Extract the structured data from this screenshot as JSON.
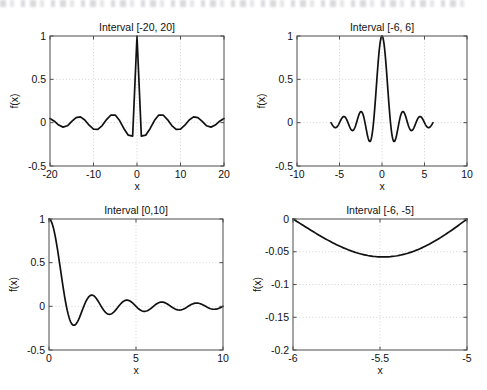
{
  "figure": {
    "width": 487,
    "height": 390,
    "background": "#ffffff",
    "curve_color": "#111111",
    "grid_color": "#c8c8c8",
    "axis_color": "#4d4d4d"
  },
  "chart_data": [
    {
      "id": "subplot-1",
      "type": "line",
      "title": "Interval [-20, 20]",
      "xlabel": "x",
      "ylabel": "f(x)",
      "xlim": [
        -20,
        20
      ],
      "ylim": [
        -0.5,
        1
      ],
      "xticks": [
        -20,
        -10,
        0,
        10,
        20
      ],
      "xticklabels": [
        "-20",
        "-10",
        "0",
        "10",
        "20"
      ],
      "yticks": [
        -0.5,
        0,
        0.5,
        1
      ],
      "yticklabels": [
        "-0.5",
        "0",
        "0.5",
        "1"
      ],
      "grid": true,
      "box": {
        "left": 50,
        "top": 36,
        "right": 224,
        "bottom": 166
      },
      "series": [
        {
          "name": "sinc(x)",
          "comment": "coarse sampling, step 1.0 over [-20,20] -> piecewise linear",
          "x": [
            -20,
            -19,
            -18,
            -17,
            -16,
            -15,
            -14,
            -13,
            -12,
            -11,
            -10,
            -9,
            -8,
            -7,
            -6,
            -5,
            -4,
            -3,
            -2,
            -1,
            0,
            1,
            2,
            3,
            4,
            5,
            6,
            7,
            8,
            9,
            10,
            11,
            12,
            13,
            14,
            15,
            16,
            17,
            18,
            19,
            20
          ],
          "y": [
            0.0477,
            0.0169,
            -0.0273,
            -0.0513,
            -0.0359,
            0.0139,
            0.0585,
            0.0668,
            0.0315,
            -0.0295,
            -0.0753,
            -0.0773,
            -0.0331,
            0.0352,
            0.0884,
            0.0879,
            0.0246,
            -0.0692,
            -0.1446,
            -0.1557,
            1.0,
            -0.1557,
            -0.1446,
            -0.0692,
            0.0246,
            0.0879,
            0.0884,
            0.0352,
            -0.0331,
            -0.0773,
            -0.0753,
            -0.0295,
            0.0315,
            0.0668,
            0.0585,
            0.0139,
            -0.0359,
            -0.0513,
            -0.0273,
            0.0169,
            0.0477
          ]
        }
      ]
    },
    {
      "id": "subplot-2",
      "type": "line",
      "title": "Interval [-6, 6]",
      "xlabel": "x",
      "ylabel": "f(x)",
      "xlim": [
        -10,
        10
      ],
      "ylim": [
        -0.5,
        1
      ],
      "xticks": [
        -10,
        -5,
        0,
        5,
        10
      ],
      "xticklabels": [
        "-10",
        "-5",
        "0",
        "5",
        "10"
      ],
      "yticks": [
        -0.5,
        0,
        0.5,
        1
      ],
      "yticklabels": [
        "-0.5",
        "0",
        "0.5",
        "1"
      ],
      "grid": true,
      "box": {
        "left": 297,
        "top": 36,
        "right": 467,
        "bottom": 166
      },
      "series": [
        {
          "name": "sinc(x) on [-6, 6]",
          "comment": "smooth sinc sampled finely, drawn only over data interval -6..6",
          "data_range": [
            -6,
            6
          ],
          "formula": "sinc",
          "samples": 241
        }
      ]
    },
    {
      "id": "subplot-3",
      "type": "line",
      "title": "Interval [0,10]",
      "xlabel": "x",
      "ylabel": "f(x)",
      "xlim": [
        0,
        10
      ],
      "ylim": [
        -0.5,
        1
      ],
      "xticks": [
        0,
        5,
        10
      ],
      "xticklabels": [
        "0",
        "5",
        "10"
      ],
      "yticks": [
        -0.5,
        0,
        0.5,
        1
      ],
      "yticklabels": [
        "-0.5",
        "0",
        "0.5",
        "1"
      ],
      "grid": true,
      "box": {
        "left": 49,
        "top": 219,
        "right": 223,
        "bottom": 350
      },
      "series": [
        {
          "name": "sinc(x) on [0, 10]",
          "data_range": [
            0,
            10
          ],
          "formula": "sinc",
          "samples": 201
        }
      ]
    },
    {
      "id": "subplot-4",
      "type": "line",
      "title": "Interval [-6, -5]",
      "xlabel": "x",
      "ylabel": "f(x)",
      "xlim": [
        -6,
        -5
      ],
      "ylim": [
        -0.2,
        0
      ],
      "xticks": [
        -6,
        -5.5,
        -5
      ],
      "xticklabels": [
        "-6",
        "-5.5",
        "-5"
      ],
      "yticks": [
        -0.2,
        -0.15,
        -0.1,
        -0.05,
        0
      ],
      "yticklabels": [
        "-0.2",
        "-0.15",
        "-0.1",
        "-0.05",
        "0"
      ],
      "grid": true,
      "box": {
        "left": 293,
        "top": 219,
        "right": 467,
        "bottom": 350
      },
      "series": [
        {
          "name": "sinc(x) on [-6, -5]",
          "data_range": [
            -6,
            -5
          ],
          "formula": "sinc",
          "samples": 101
        }
      ]
    }
  ]
}
